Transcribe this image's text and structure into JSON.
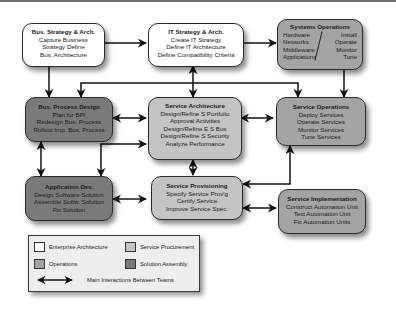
{
  "nodes": {
    "bus_strategy": {
      "title": "Bus. Strategy & Arch.",
      "lines": [
        "Capture Business",
        "Strategy Define",
        "Bus. Architecture"
      ],
      "category": "Enterprise Architecture"
    },
    "it_strategy": {
      "title": "IT Strategy & Arch.",
      "lines": [
        "Create IT Strategy",
        "Define IT Architecture",
        "Define Compatibility Criteria"
      ],
      "category": "Enterprise Architecture"
    },
    "systems_ops": {
      "title": "Systems Operations",
      "left": [
        "Hardware",
        "Networks",
        "Middleware",
        "Applications"
      ],
      "right": [
        "Install",
        "Operate",
        "Monitor",
        "Tune"
      ],
      "category": "Operations"
    },
    "bus_process": {
      "title": "Bus. Process Design",
      "lines": [
        "Plan for BPI",
        "Redesign Bus. Process",
        "Rollout Imp. Bus. Process"
      ],
      "category": "Solution Assembly"
    },
    "service_arch": {
      "title": "Service Architecture",
      "lines": [
        "Design/Refine S Portfolio",
        "Approval Activities",
        "Design/Refine E S Bus",
        "Design/Refine S Security",
        "Analyze Performance"
      ],
      "category": "Service Procurement"
    },
    "service_ops": {
      "title": "Service Operations",
      "lines": [
        "Deploy Services",
        "Operate Services",
        "Monitor Services",
        "Tune Services"
      ],
      "category": "Operations"
    },
    "app_dev": {
      "title": "Application Dev.",
      "lines": [
        "Design Software Solution",
        "Assemble Softw. Solution",
        "Fix Solution"
      ],
      "category": "Solution Assembly"
    },
    "service_prov": {
      "title": "Service Provisioning",
      "lines": [
        "Specify Service Prov'g",
        "Certify Service",
        "Improve Service Spec."
      ],
      "category": "Service Procurement"
    },
    "service_impl": {
      "title": "Service Implementation",
      "lines": [
        "Construct Automation Unit",
        "Test Automation Unit",
        "Fix Automation Units"
      ],
      "category": "Operations"
    }
  },
  "legend": {
    "items": [
      {
        "label": "Enterprise Architecture",
        "color": "#ffffff"
      },
      {
        "label": "Service Procurement",
        "color": "#c4c4c4"
      },
      {
        "label": "Operations",
        "color": "#a4a4a4"
      },
      {
        "label": "Solution Assembly",
        "color": "#7a7a7a"
      }
    ],
    "arrow_label": "Main Interactions Between Teams"
  },
  "edges": [
    {
      "from": "bus_strategy",
      "to": "it_strategy",
      "type": "one-way"
    },
    {
      "from": "it_strategy",
      "to": "systems_ops",
      "type": "one-way"
    },
    {
      "from": "bus_strategy",
      "to": "bus_process",
      "type": "one-way"
    },
    {
      "from": "it_strategy",
      "to": "service_arch",
      "type": "two-way"
    },
    {
      "from": "it_strategy",
      "to": "bus_process",
      "type": "one-way"
    },
    {
      "from": "it_strategy",
      "to": "service_ops",
      "type": "one-way"
    },
    {
      "from": "systems_ops",
      "to": "service_ops",
      "type": "one-way"
    },
    {
      "from": "bus_process",
      "to": "service_arch",
      "type": "two-way"
    },
    {
      "from": "service_arch",
      "to": "service_ops",
      "type": "two-way"
    },
    {
      "from": "bus_process",
      "to": "app_dev",
      "type": "two-way"
    },
    {
      "from": "bus_process",
      "to": "service_arch",
      "type": "one-way"
    },
    {
      "from": "bus_process",
      "to": "app_dev",
      "type": "one-way"
    },
    {
      "from": "service_arch",
      "to": "service_prov",
      "type": "two-way"
    },
    {
      "from": "app_dev",
      "to": "service_prov",
      "type": "two-way"
    },
    {
      "from": "service_ops",
      "to": "service_prov",
      "type": "two-way"
    },
    {
      "from": "service_prov",
      "to": "service_impl",
      "type": "two-way"
    }
  ],
  "colors": {
    "enterprise_architecture": "#ffffff",
    "service_procurement": "#c4c4c4",
    "operations": "#a4a4a4",
    "solution_assembly": "#7a7a7a"
  }
}
